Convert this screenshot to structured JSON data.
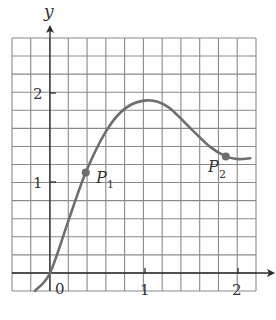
{
  "chart_data": {
    "type": "line",
    "title": "",
    "xlabel": "",
    "ylabel": "y",
    "xlim": [
      -0.4,
      2.2
    ],
    "ylim": [
      -0.2,
      2.6
    ],
    "grid": true,
    "grid_step": {
      "x": 0.2,
      "y": 0.2
    },
    "x_ticks": [
      {
        "value": 0,
        "label": "0"
      },
      {
        "value": 1,
        "label": "1"
      },
      {
        "value": 2,
        "label": "2"
      }
    ],
    "y_ticks": [
      {
        "value": 1,
        "label": "1"
      },
      {
        "value": 2,
        "label": "2"
      }
    ],
    "series": [
      {
        "name": "curve",
        "x": [
          -0.16,
          0.0,
          0.2,
          0.38,
          0.6,
          0.8,
          1.03,
          1.25,
          1.5,
          1.7,
          1.87,
          2.0,
          2.13
        ],
        "y": [
          -0.2,
          0.0,
          0.6,
          1.13,
          1.6,
          1.85,
          1.94,
          1.87,
          1.62,
          1.42,
          1.31,
          1.28,
          1.29
        ]
      }
    ],
    "points": [
      {
        "name": "P1",
        "label": "P",
        "subscript": "1",
        "x": 0.38,
        "y": 1.13
      },
      {
        "name": "P2",
        "label": "P",
        "subscript": "2",
        "x": 1.87,
        "y": 1.31
      }
    ],
    "legend": null
  },
  "labels": {
    "y_axis": "y",
    "origin": "0",
    "x1": "1",
    "x2": "2",
    "y1": "1",
    "y2": "2",
    "p1_main": "P",
    "p1_sub": "1",
    "p2_main": "P",
    "p2_sub": "2"
  },
  "colors": {
    "grid": "#8a8a8a",
    "axis": "#2a2a2a",
    "curve": "#6e6e6e",
    "point": "#6e6e6e"
  }
}
